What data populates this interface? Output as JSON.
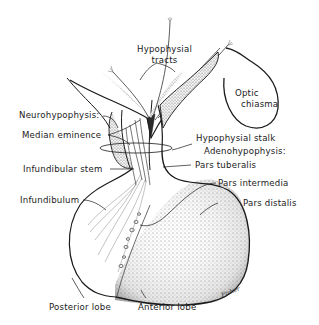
{
  "diagram": {
    "type": "anatomical illustration",
    "labels": {
      "hypophysial_tracts_line1": "Hypophysial",
      "hypophysial_tracts_line2": "tracts",
      "optic_chiasma_line1": "Optic",
      "optic_chiasma_line2": "chiasma",
      "neurohypophysis": "Neurohypophysis:",
      "median_eminence": "Median eminence",
      "hypophysial_stalk": "Hypophysial stalk",
      "adenohypophysis": "Adenohypophysis:",
      "infundibular_stem": "Infundibular stem",
      "pars_tuberalis": "Pars tuberalis",
      "pars_intermedia": "Pars intermedia",
      "infundibulum": "Infundibulum",
      "pars_distalis": "Pars distalis",
      "posterior_lobe": "Posterior lobe",
      "anterior_lobe": "Anterior lobe"
    },
    "signature": "Fisher"
  },
  "colors": {
    "ink": "#1a1a1a",
    "stipple": "#8a8a8a",
    "background": "#ffffff"
  }
}
